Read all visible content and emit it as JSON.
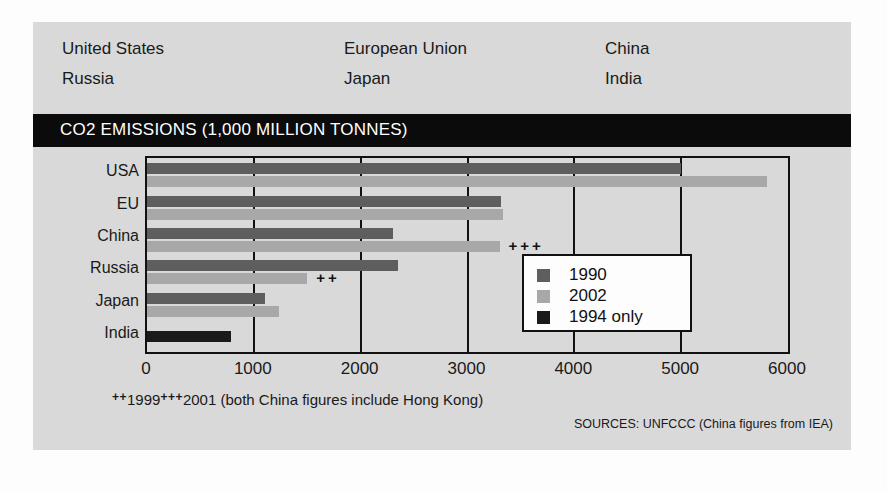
{
  "header": {
    "columns": [
      [
        "United States",
        "Russia"
      ],
      [
        "European Union",
        "Japan"
      ],
      [
        "China",
        "India"
      ]
    ]
  },
  "title": "CO2 EMISSIONS (1,000 MILLION TONNES)",
  "legend": {
    "items": [
      {
        "label": "1990",
        "color": "#5e5e5e"
      },
      {
        "label": "2002",
        "color": "#a8a8a8"
      },
      {
        "label": "1994 only",
        "color": "#1a1a1a"
      }
    ]
  },
  "footnote": {
    "mark1": "++",
    "year1": "1999",
    "mark2": "+++",
    "year2": "2001",
    "note": " (both China figures include Hong Kong)"
  },
  "sources": "SOURCES: UNFCCC (China figures from IEA)",
  "colors": {
    "panel_background": "#d9d9d9",
    "title_band": "#0b0b0b",
    "title_text": "#ffffff",
    "series_1990": "#5e5e5e",
    "series_2002": "#a8a8a8",
    "series_1994": "#1a1a1a",
    "axis": "#111111"
  },
  "chart_data": {
    "type": "bar",
    "orientation": "horizontal",
    "title": "CO2 EMISSIONS (1,000 MILLION TONNES)",
    "xlabel": "",
    "ylabel": "",
    "xlim": [
      0,
      6000
    ],
    "ticks": [
      0,
      1000,
      2000,
      3000,
      4000,
      5000,
      6000
    ],
    "tick_labels": [
      "0",
      "1000",
      "2000",
      "3000",
      "4000",
      "5000",
      "6000"
    ],
    "grid": true,
    "legend_position": "inside-right",
    "categories": [
      "USA",
      "EU",
      "China",
      "Russia",
      "Japan",
      "India"
    ],
    "series": [
      {
        "name": "1990",
        "color": "#5e5e5e",
        "values": [
          5000,
          3310,
          2300,
          2350,
          1100,
          null
        ]
      },
      {
        "name": "2002",
        "color": "#a8a8a8",
        "values": [
          5800,
          3330,
          3300,
          1500,
          1240,
          null
        ]
      },
      {
        "name": "1994 only",
        "color": "#1a1a1a",
        "values": [
          null,
          null,
          null,
          null,
          null,
          790
        ]
      }
    ],
    "annotations": [
      {
        "text": "+++",
        "category": "China",
        "series": "2002",
        "value": 3300
      },
      {
        "text": "++",
        "category": "Russia",
        "series": "2002",
        "value": 1500
      }
    ]
  }
}
